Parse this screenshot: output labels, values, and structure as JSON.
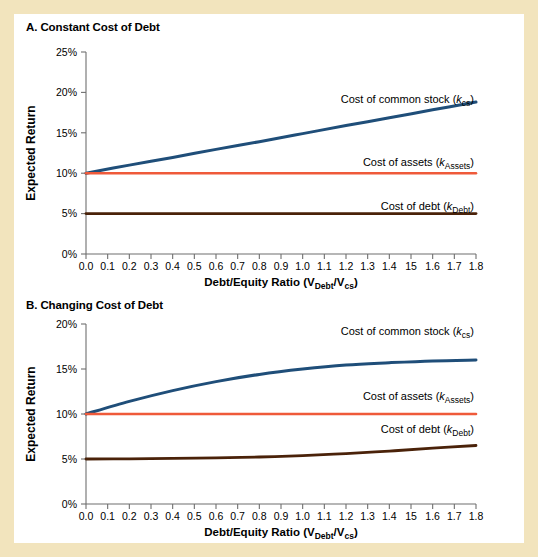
{
  "figure": {
    "background_color": "#f2e4bd",
    "panel_background": "#ffffff"
  },
  "colors": {
    "common_stock": "#1f4e79",
    "assets": "#ef5a3a",
    "debt": "#4a2209",
    "axis": "#6f6f6f",
    "text": "#000000"
  },
  "panel_a": {
    "title": "A. Constant Cost of Debt",
    "ylabel": "Expected Return",
    "xlabel_main": "Debt/Equity Ratio (V",
    "xlabel_sub1": "Debt",
    "xlabel_mid": "/V",
    "xlabel_sub2": "cs",
    "xlabel_end": ")",
    "yticks": [
      "0%",
      "5%",
      "10%",
      "15%",
      "20%",
      "25%"
    ],
    "xticks": [
      "0.0",
      "0.1",
      "0.2",
      "0.3",
      "0.4",
      "0.5",
      "0.6",
      "0.7",
      "0.8",
      "0.9",
      "1.0",
      "1.1",
      "1.2",
      "1.3",
      "1.4",
      "15",
      "1.6",
      "1.7",
      "1.8"
    ],
    "label_common_stock_text": "Cost of common stock (",
    "label_common_stock_k": "k",
    "label_common_stock_sub": "cs",
    "label_common_stock_end": ")",
    "label_assets_text": "Cost of assets (",
    "label_assets_k": "k",
    "label_assets_sub": "Assets",
    "label_assets_end": ")",
    "label_debt_text": "Cost of debt (",
    "label_debt_k": "k",
    "label_debt_sub": "Debt",
    "label_debt_end": ")"
  },
  "panel_b": {
    "title": "B. Changing Cost of Debt",
    "ylabel": "Expected Return",
    "xlabel_main": "Debt/Equity Ratio (V",
    "xlabel_sub1": "Debt",
    "xlabel_mid": "/V",
    "xlabel_sub2": "cs",
    "xlabel_end": ")",
    "yticks": [
      "0%",
      "5%",
      "10%",
      "15%",
      "20%"
    ],
    "xticks": [
      "0.0",
      "0.1",
      "0.2",
      "0.3",
      "0.4",
      "0.5",
      "0.6",
      "0.7",
      "0.8",
      "0.9",
      "1.0",
      "1.1",
      "1.2",
      "1.3",
      "1.4",
      "15",
      "1.6",
      "1.7",
      "1.8"
    ],
    "label_common_stock_text": "Cost of common stock (",
    "label_common_stock_k": "k",
    "label_common_stock_sub": "cs",
    "label_common_stock_end": ")",
    "label_assets_text": "Cost of assets (",
    "label_assets_k": "k",
    "label_assets_sub": "Assets",
    "label_assets_end": ")",
    "label_debt_text": "Cost of debt (",
    "label_debt_k": "k",
    "label_debt_sub": "Debt",
    "label_debt_end": ")"
  },
  "chart_data": [
    {
      "type": "line",
      "title": "A. Constant Cost of Debt",
      "xlabel": "Debt/Equity Ratio (V_Debt/V_cs)",
      "ylabel": "Expected Return",
      "xlim": [
        0.0,
        1.8
      ],
      "ylim": [
        0,
        25
      ],
      "yticks": [
        0,
        5,
        10,
        15,
        20,
        25
      ],
      "xticks": [
        0.0,
        0.1,
        0.2,
        0.3,
        0.4,
        0.5,
        0.6,
        0.7,
        0.8,
        0.9,
        1.0,
        1.1,
        1.2,
        1.3,
        1.4,
        1.5,
        1.6,
        1.7,
        1.8
      ],
      "grid": false,
      "legend_position": "inline-annotations",
      "x": [
        0.0,
        0.2,
        0.4,
        0.6,
        0.8,
        1.0,
        1.2,
        1.4,
        1.6,
        1.8
      ],
      "series": [
        {
          "name": "Cost of common stock (k_cs)",
          "color": "#1f4e79",
          "values": [
            10.0,
            11.0,
            11.95,
            12.95,
            13.9,
            14.9,
            15.9,
            16.85,
            17.85,
            18.8
          ]
        },
        {
          "name": "Cost of assets (k_Assets)",
          "color": "#ef5a3a",
          "values": [
            10.0,
            10.0,
            10.0,
            10.0,
            10.0,
            10.0,
            10.0,
            10.0,
            10.0,
            10.0
          ]
        },
        {
          "name": "Cost of debt (k_Debt)",
          "color": "#4a2209",
          "values": [
            5.0,
            5.0,
            5.0,
            5.0,
            5.0,
            5.0,
            5.0,
            5.0,
            5.0,
            5.0
          ]
        }
      ]
    },
    {
      "type": "line",
      "title": "B. Changing Cost of Debt",
      "xlabel": "Debt/Equity Ratio (V_Debt/V_cs)",
      "ylabel": "Expected Return",
      "xlim": [
        0.0,
        1.8
      ],
      "ylim": [
        0,
        20
      ],
      "yticks": [
        0,
        5,
        10,
        15,
        20
      ],
      "xticks": [
        0.0,
        0.1,
        0.2,
        0.3,
        0.4,
        0.5,
        0.6,
        0.7,
        0.8,
        0.9,
        1.0,
        1.1,
        1.2,
        1.3,
        1.4,
        1.5,
        1.6,
        1.7,
        1.8
      ],
      "grid": false,
      "legend_position": "inline-annotations",
      "x": [
        0.0,
        0.2,
        0.4,
        0.6,
        0.8,
        1.0,
        1.2,
        1.4,
        1.6,
        1.8
      ],
      "series": [
        {
          "name": "Cost of common stock (k_cs)",
          "color": "#1f4e79",
          "values": [
            10.0,
            11.4,
            12.6,
            13.6,
            14.4,
            15.0,
            15.45,
            15.7,
            15.9,
            16.0
          ]
        },
        {
          "name": "Cost of assets (k_Assets)",
          "color": "#ef5a3a",
          "values": [
            10.0,
            10.0,
            10.0,
            10.0,
            10.0,
            10.0,
            10.0,
            10.0,
            10.0,
            10.0
          ]
        },
        {
          "name": "Cost of debt (k_Debt)",
          "color": "#4a2209",
          "values": [
            5.0,
            5.02,
            5.06,
            5.12,
            5.22,
            5.38,
            5.6,
            5.88,
            6.2,
            6.5
          ]
        }
      ]
    }
  ]
}
